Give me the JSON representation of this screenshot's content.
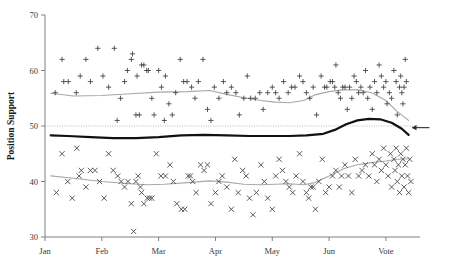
{
  "chart_data": {
    "type": "scatter",
    "title": "",
    "subtitle": "",
    "xlabel": "",
    "ylabel": "Position Support",
    "xlim": [
      0,
      6.6
    ],
    "ylim": [
      30,
      70
    ],
    "grid": false,
    "legend_position": "none",
    "x_tick_labels": [
      "Jan",
      "Feb",
      "Mar",
      "Apr",
      "May",
      "Jun",
      "Vote"
    ],
    "x_tick_values": [
      0,
      1,
      2,
      3,
      4,
      5,
      6
    ],
    "y_tick_labels": [
      "30",
      "40",
      "50",
      "60",
      "70"
    ],
    "y_tick_values": [
      30,
      40,
      50,
      60,
      70
    ],
    "annotations": [
      {
        "name": "fifty-percent-reference-line",
        "type": "hline",
        "y": 50,
        "style": "dotted",
        "color": "#b9b9b9"
      },
      {
        "name": "vote-outcome-arrow",
        "type": "arrow",
        "x": 6.45,
        "y": 49.7,
        "direction": "left",
        "color": "#2b2b2b"
      }
    ],
    "series": [
      {
        "name": "Yes / Support polls",
        "marker": "plus",
        "color": "#3d3d3d",
        "points": [
          [
            0.18,
            56
          ],
          [
            0.33,
            58
          ],
          [
            0.41,
            58
          ],
          [
            0.3,
            62
          ],
          [
            0.55,
            56
          ],
          [
            0.62,
            59
          ],
          [
            0.72,
            62
          ],
          [
            0.8,
            58
          ],
          [
            0.93,
            64
          ],
          [
            1.02,
            59
          ],
          [
            1.12,
            57
          ],
          [
            1.22,
            64
          ],
          [
            1.27,
            51
          ],
          [
            1.33,
            55
          ],
          [
            1.4,
            58
          ],
          [
            1.45,
            60
          ],
          [
            1.52,
            62
          ],
          [
            1.54,
            63
          ],
          [
            1.62,
            59
          ],
          [
            1.66,
            52
          ],
          [
            1.6,
            52
          ],
          [
            1.7,
            61
          ],
          [
            1.74,
            61
          ],
          [
            1.79,
            60
          ],
          [
            1.82,
            60
          ],
          [
            1.88,
            55
          ],
          [
            1.92,
            52
          ],
          [
            2.0,
            60
          ],
          [
            2.05,
            57
          ],
          [
            2.1,
            51
          ],
          [
            2.12,
            59
          ],
          [
            2.18,
            54
          ],
          [
            2.24,
            52
          ],
          [
            2.3,
            56
          ],
          [
            2.38,
            62
          ],
          [
            2.44,
            58
          ],
          [
            2.5,
            58
          ],
          [
            2.58,
            57
          ],
          [
            2.64,
            55
          ],
          [
            2.7,
            58
          ],
          [
            2.78,
            62
          ],
          [
            2.86,
            53
          ],
          [
            2.92,
            51
          ],
          [
            2.98,
            57
          ],
          [
            3.06,
            55
          ],
          [
            3.14,
            58
          ],
          [
            3.2,
            56
          ],
          [
            3.28,
            57
          ],
          [
            3.36,
            56
          ],
          [
            3.42,
            52
          ],
          [
            3.5,
            55
          ],
          [
            3.56,
            59
          ],
          [
            3.62,
            55
          ],
          [
            3.7,
            55
          ],
          [
            3.78,
            56
          ],
          [
            3.84,
            53
          ],
          [
            3.92,
            56
          ],
          [
            4.0,
            57
          ],
          [
            4.06,
            56
          ],
          [
            4.12,
            55
          ],
          [
            4.2,
            58
          ],
          [
            4.28,
            56
          ],
          [
            4.34,
            57
          ],
          [
            4.4,
            57
          ],
          [
            4.48,
            59
          ],
          [
            4.54,
            58
          ],
          [
            4.6,
            56
          ],
          [
            4.66,
            55
          ],
          [
            4.72,
            57
          ],
          [
            4.78,
            52
          ],
          [
            4.86,
            59
          ],
          [
            4.92,
            57
          ],
          [
            4.96,
            57
          ],
          [
            5.02,
            58
          ],
          [
            5.06,
            58
          ],
          [
            5.1,
            57
          ],
          [
            5.12,
            61
          ],
          [
            5.16,
            56
          ],
          [
            5.2,
            55
          ],
          [
            5.24,
            57
          ],
          [
            5.28,
            57
          ],
          [
            5.32,
            53
          ],
          [
            5.36,
            57
          ],
          [
            5.4,
            55
          ],
          [
            5.44,
            59
          ],
          [
            5.48,
            58
          ],
          [
            5.52,
            56
          ],
          [
            5.56,
            57
          ],
          [
            5.6,
            56
          ],
          [
            5.64,
            60
          ],
          [
            5.68,
            55
          ],
          [
            5.72,
            57
          ],
          [
            5.76,
            53
          ],
          [
            5.8,
            58
          ],
          [
            5.84,
            56
          ],
          [
            5.88,
            61
          ],
          [
            5.92,
            59
          ],
          [
            5.96,
            57
          ],
          [
            6.0,
            58
          ],
          [
            6.02,
            54
          ],
          [
            6.06,
            56
          ],
          [
            6.1,
            55
          ],
          [
            6.14,
            60
          ],
          [
            6.18,
            58
          ],
          [
            6.2,
            52
          ],
          [
            6.24,
            57
          ],
          [
            6.26,
            59
          ],
          [
            6.28,
            56
          ],
          [
            6.3,
            54
          ],
          [
            6.32,
            57
          ],
          [
            6.34,
            62
          ],
          [
            6.36,
            58
          ]
        ]
      },
      {
        "name": "No / Oppose polls",
        "marker": "cross",
        "color": "#3d3d3d",
        "points": [
          [
            0.2,
            38
          ],
          [
            0.3,
            45
          ],
          [
            0.4,
            40
          ],
          [
            0.48,
            37
          ],
          [
            0.56,
            46
          ],
          [
            0.6,
            41
          ],
          [
            0.64,
            42
          ],
          [
            0.72,
            39
          ],
          [
            0.8,
            42
          ],
          [
            0.88,
            42
          ],
          [
            0.96,
            40
          ],
          [
            1.04,
            37
          ],
          [
            1.12,
            45
          ],
          [
            1.2,
            42
          ],
          [
            1.28,
            41
          ],
          [
            1.34,
            40
          ],
          [
            1.4,
            39
          ],
          [
            1.46,
            40
          ],
          [
            1.52,
            36
          ],
          [
            1.56,
            31
          ],
          [
            1.6,
            40
          ],
          [
            1.64,
            41
          ],
          [
            1.68,
            39
          ],
          [
            1.7,
            38
          ],
          [
            1.74,
            36
          ],
          [
            1.8,
            37
          ],
          [
            1.84,
            37
          ],
          [
            1.88,
            37
          ],
          [
            1.96,
            45
          ],
          [
            2.04,
            41
          ],
          [
            2.12,
            41
          ],
          [
            2.2,
            43
          ],
          [
            2.26,
            40
          ],
          [
            2.32,
            36
          ],
          [
            2.4,
            35
          ],
          [
            2.46,
            35
          ],
          [
            2.52,
            41
          ],
          [
            2.56,
            41
          ],
          [
            2.6,
            40
          ],
          [
            2.66,
            38
          ],
          [
            2.74,
            43
          ],
          [
            2.8,
            42
          ],
          [
            2.86,
            43
          ],
          [
            2.92,
            36
          ],
          [
            3.0,
            38
          ],
          [
            3.06,
            40
          ],
          [
            3.12,
            41
          ],
          [
            3.2,
            39
          ],
          [
            3.28,
            35
          ],
          [
            3.34,
            44
          ],
          [
            3.4,
            38
          ],
          [
            3.48,
            42
          ],
          [
            3.54,
            41
          ],
          [
            3.6,
            37
          ],
          [
            3.66,
            34
          ],
          [
            3.72,
            38
          ],
          [
            3.8,
            43
          ],
          [
            3.86,
            40
          ],
          [
            3.92,
            37
          ],
          [
            4.0,
            35
          ],
          [
            4.06,
            41
          ],
          [
            4.12,
            44
          ],
          [
            4.18,
            42
          ],
          [
            4.24,
            40
          ],
          [
            4.3,
            39
          ],
          [
            4.36,
            38
          ],
          [
            4.42,
            41
          ],
          [
            4.48,
            45
          ],
          [
            4.54,
            40
          ],
          [
            4.6,
            38
          ],
          [
            4.64,
            37
          ],
          [
            4.68,
            39
          ],
          [
            4.72,
            39
          ],
          [
            4.76,
            35
          ],
          [
            4.82,
            40
          ],
          [
            4.88,
            44
          ],
          [
            4.94,
            38
          ],
          [
            5.0,
            39
          ],
          [
            5.06,
            41
          ],
          [
            5.12,
            42
          ],
          [
            5.18,
            39
          ],
          [
            5.22,
            41
          ],
          [
            5.28,
            43
          ],
          [
            5.34,
            41
          ],
          [
            5.4,
            38
          ],
          [
            5.46,
            44
          ],
          [
            5.52,
            41
          ],
          [
            5.58,
            42
          ],
          [
            5.64,
            43
          ],
          [
            5.7,
            41
          ],
          [
            5.76,
            45
          ],
          [
            5.8,
            43
          ],
          [
            5.84,
            40
          ],
          [
            5.88,
            44
          ],
          [
            5.92,
            42
          ],
          [
            5.96,
            46
          ],
          [
            6.0,
            43
          ],
          [
            6.04,
            41
          ],
          [
            6.08,
            45
          ],
          [
            6.1,
            39
          ],
          [
            6.14,
            44
          ],
          [
            6.16,
            42
          ],
          [
            6.18,
            46
          ],
          [
            6.2,
            40
          ],
          [
            6.22,
            43
          ],
          [
            6.24,
            38
          ],
          [
            6.26,
            45
          ],
          [
            6.28,
            41
          ],
          [
            6.3,
            44
          ],
          [
            6.32,
            39
          ],
          [
            6.34,
            43
          ],
          [
            6.36,
            46
          ],
          [
            6.38,
            41
          ],
          [
            6.4,
            38
          ],
          [
            6.42,
            44
          ],
          [
            6.44,
            40
          ]
        ]
      }
    ],
    "trend_lines": [
      {
        "name": "support-trend",
        "style": "thin-gray",
        "color": "#a8a8a8",
        "points": [
          [
            0.1,
            55.9
          ],
          [
            0.5,
            55.4
          ],
          [
            1.0,
            55.5
          ],
          [
            1.5,
            55.8
          ],
          [
            2.0,
            56.1
          ],
          [
            2.5,
            56.2
          ],
          [
            2.9,
            56.4
          ],
          [
            3.2,
            55.7
          ],
          [
            3.5,
            55.1
          ],
          [
            3.8,
            54.6
          ],
          [
            4.05,
            54.3
          ],
          [
            4.3,
            54.2
          ],
          [
            4.55,
            54.6
          ],
          [
            4.75,
            55.6
          ],
          [
            5.0,
            56.2
          ],
          [
            5.25,
            56.5
          ],
          [
            5.5,
            56.5
          ],
          [
            5.75,
            56.0
          ],
          [
            6.0,
            54.6
          ],
          [
            6.2,
            52.6
          ],
          [
            6.4,
            51.0
          ]
        ]
      },
      {
        "name": "oppose-trend",
        "style": "thin-gray",
        "color": "#a8a8a8",
        "points": [
          [
            0.1,
            41.0
          ],
          [
            0.5,
            40.6
          ],
          [
            1.0,
            40.0
          ],
          [
            1.5,
            39.6
          ],
          [
            1.8,
            39.4
          ],
          [
            2.1,
            39.5
          ],
          [
            2.5,
            39.8
          ],
          [
            2.9,
            40.1
          ],
          [
            3.2,
            39.9
          ],
          [
            3.5,
            39.5
          ],
          [
            3.8,
            39.4
          ],
          [
            4.05,
            39.5
          ],
          [
            4.3,
            39.6
          ],
          [
            4.55,
            39.4
          ],
          [
            4.75,
            39.8
          ],
          [
            5.0,
            41.0
          ],
          [
            5.25,
            42.3
          ],
          [
            5.5,
            43.0
          ],
          [
            5.75,
            43.4
          ],
          [
            6.0,
            43.7
          ],
          [
            6.2,
            44.0
          ],
          [
            6.4,
            44.1
          ]
        ]
      },
      {
        "name": "net-position-trend",
        "style": "thick-black",
        "color": "#111111",
        "points": [
          [
            0.1,
            48.3
          ],
          [
            0.4,
            48.2
          ],
          [
            0.8,
            48.0
          ],
          [
            1.2,
            47.8
          ],
          [
            1.6,
            47.8
          ],
          [
            2.0,
            48.0
          ],
          [
            2.4,
            48.3
          ],
          [
            2.8,
            48.4
          ],
          [
            3.2,
            48.3
          ],
          [
            3.6,
            48.2
          ],
          [
            4.0,
            48.2
          ],
          [
            4.3,
            48.2
          ],
          [
            4.6,
            48.3
          ],
          [
            4.9,
            48.6
          ],
          [
            5.1,
            49.3
          ],
          [
            5.3,
            50.3
          ],
          [
            5.5,
            51.0
          ],
          [
            5.7,
            51.3
          ],
          [
            5.9,
            51.2
          ],
          [
            6.1,
            50.6
          ],
          [
            6.28,
            49.5
          ],
          [
            6.4,
            48.4
          ]
        ]
      }
    ]
  }
}
